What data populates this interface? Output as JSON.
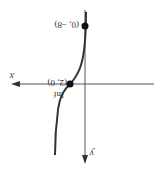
{
  "diagram": {
    "orientation": "rotated 180 degrees",
    "axes": {
      "x_label": "x",
      "y_label": "y"
    },
    "points": [
      {
        "label": "(0, −8)",
        "description": "y-intercept"
      },
      {
        "label": "(2, 0)",
        "description": "x-intercept / inflection point",
        "annotation": "Inf"
      }
    ],
    "curve": "cubic-like curve through (0, −8) and inflection at (2, 0)",
    "colors": {
      "axis": "#555555",
      "curve": "#333333",
      "point": "#111111"
    }
  }
}
